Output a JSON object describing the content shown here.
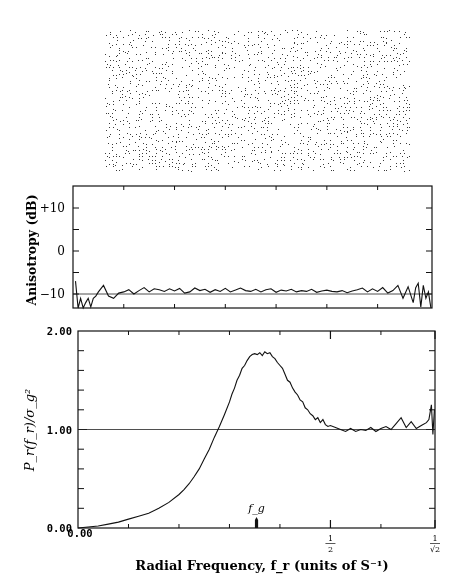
{
  "halftone": {
    "description": "Blue-noise dither pattern sample",
    "dot_color": "#3a3a3a"
  },
  "chart_data": [
    {
      "type": "line",
      "name": "anisotropy",
      "title": "",
      "ylabel": "Anisotropy (dB)",
      "xlabel": "",
      "xlim": [
        0,
        0.7071
      ],
      "ylim": [
        -15,
        15
      ],
      "yticks": [
        {
          "value": 10,
          "label": "+10"
        },
        {
          "value": 0,
          "label": "0"
        },
        {
          "value": -10,
          "label": "−10"
        }
      ],
      "reference_line": -10,
      "series": [
        {
          "name": "anisotropy",
          "x": [
            0.005,
            0.01,
            0.015,
            0.02,
            0.025,
            0.03,
            0.035,
            0.04,
            0.045,
            0.05,
            0.06,
            0.07,
            0.08,
            0.09,
            0.1,
            0.11,
            0.12,
            0.13,
            0.14,
            0.15,
            0.16,
            0.17,
            0.18,
            0.19,
            0.2,
            0.21,
            0.22,
            0.23,
            0.24,
            0.25,
            0.26,
            0.27,
            0.28,
            0.29,
            0.3,
            0.31,
            0.32,
            0.33,
            0.34,
            0.35,
            0.36,
            0.37,
            0.38,
            0.39,
            0.4,
            0.41,
            0.42,
            0.43,
            0.44,
            0.45,
            0.46,
            0.47,
            0.48,
            0.49,
            0.5,
            0.51,
            0.52,
            0.53,
            0.54,
            0.55,
            0.56,
            0.57,
            0.58,
            0.59,
            0.6,
            0.61,
            0.62,
            0.63,
            0.64,
            0.65,
            0.66,
            0.67,
            0.675,
            0.68,
            0.685,
            0.69,
            0.695,
            0.7,
            0.705
          ],
          "y": [
            -7,
            -15,
            -11,
            -15,
            -12,
            -11,
            -13,
            -11,
            -10.5,
            -9.5,
            -8,
            -10.5,
            -11,
            -9.8,
            -9.5,
            -9,
            -10,
            -9.2,
            -8.5,
            -9.5,
            -8.8,
            -9,
            -9.4,
            -8.8,
            -9.3,
            -8.7,
            -9.8,
            -9.5,
            -8.6,
            -9.2,
            -8.9,
            -9.6,
            -9,
            -9.4,
            -8.7,
            -9.5,
            -9.1,
            -8.6,
            -9.2,
            -9.4,
            -8.9,
            -9.5,
            -9,
            -8.8,
            -9.6,
            -9.1,
            -9.3,
            -8.9,
            -9.5,
            -9.2,
            -9.4,
            -8.9,
            -9.6,
            -9.3,
            -9.1,
            -9.4,
            -9.5,
            -9.2,
            -9.7,
            -9.3,
            -9,
            -8.6,
            -9.5,
            -8.8,
            -9.4,
            -8.5,
            -9.8,
            -9.2,
            -8,
            -11,
            -8.3,
            -12,
            -8.5,
            -7.5,
            -13,
            -8,
            -11,
            -9.5,
            -14
          ]
        }
      ]
    },
    {
      "type": "line",
      "name": "radial-power-spectrum",
      "title": "",
      "ylabel": "P_r(f_r)/σ_g²",
      "xlabel": "Radial Frequency, f_r (units of S⁻¹)",
      "xlim": [
        0,
        0.7071
      ],
      "ylim": [
        0,
        2
      ],
      "yticks": [
        {
          "value": 2,
          "label": "2.00"
        },
        {
          "value": 1,
          "label": "1.00"
        },
        {
          "value": 0,
          "label": "0.00"
        }
      ],
      "xticks": [
        {
          "value": 0,
          "label": "0.00"
        },
        {
          "value": 0.5,
          "label": "1/2"
        },
        {
          "value": 0.7071,
          "label": "1/√2"
        }
      ],
      "x_minor_ticks": [
        0.1,
        0.2,
        0.3,
        0.4,
        0.6
      ],
      "y_minor_step": 0.2,
      "annotations": [
        {
          "label": "f_g",
          "x": 0.3536,
          "kind": "arrow-marker"
        }
      ],
      "reference_line": 1.0,
      "series": [
        {
          "name": "radial power",
          "x": [
            0,
            0.02,
            0.04,
            0.06,
            0.08,
            0.1,
            0.12,
            0.14,
            0.16,
            0.18,
            0.2,
            0.21,
            0.22,
            0.23,
            0.24,
            0.25,
            0.26,
            0.27,
            0.28,
            0.29,
            0.3,
            0.305,
            0.31,
            0.315,
            0.32,
            0.325,
            0.33,
            0.335,
            0.34,
            0.345,
            0.35,
            0.355,
            0.36,
            0.365,
            0.37,
            0.375,
            0.38,
            0.385,
            0.39,
            0.395,
            0.4,
            0.405,
            0.41,
            0.415,
            0.42,
            0.425,
            0.43,
            0.435,
            0.44,
            0.445,
            0.45,
            0.455,
            0.46,
            0.465,
            0.47,
            0.475,
            0.48,
            0.485,
            0.49,
            0.495,
            0.5,
            0.51,
            0.52,
            0.53,
            0.54,
            0.55,
            0.56,
            0.57,
            0.58,
            0.59,
            0.6,
            0.61,
            0.62,
            0.63,
            0.64,
            0.65,
            0.66,
            0.67,
            0.68,
            0.69,
            0.695,
            0.7,
            0.703,
            0.706
          ],
          "y": [
            0.0,
            0.01,
            0.02,
            0.04,
            0.06,
            0.09,
            0.12,
            0.15,
            0.2,
            0.26,
            0.34,
            0.39,
            0.45,
            0.52,
            0.6,
            0.7,
            0.8,
            0.92,
            1.03,
            1.15,
            1.28,
            1.36,
            1.42,
            1.5,
            1.55,
            1.62,
            1.65,
            1.7,
            1.74,
            1.76,
            1.77,
            1.76,
            1.78,
            1.75,
            1.79,
            1.77,
            1.78,
            1.74,
            1.72,
            1.68,
            1.65,
            1.62,
            1.56,
            1.5,
            1.48,
            1.42,
            1.38,
            1.35,
            1.3,
            1.28,
            1.22,
            1.2,
            1.16,
            1.14,
            1.1,
            1.12,
            1.07,
            1.1,
            1.05,
            1.03,
            1.04,
            1.02,
            1.0,
            0.98,
            1.01,
            0.98,
            1.0,
            0.99,
            1.02,
            0.98,
            1.01,
            1.03,
            1.0,
            1.06,
            1.12,
            1.02,
            1.08,
            1.01,
            1.04,
            1.07,
            1.1,
            1.25,
            0.95,
            1.2
          ]
        }
      ]
    }
  ]
}
